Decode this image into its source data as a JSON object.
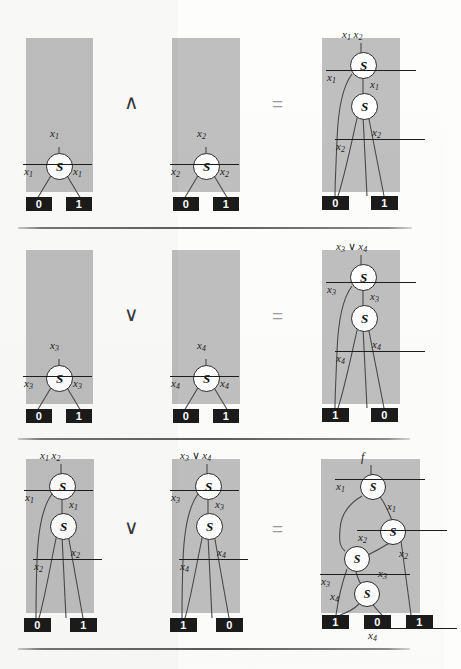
{
  "figure": {
    "kind": "binary-decision-diagram-identities",
    "node_symbol": "S",
    "colors": {
      "panel_gray": "#bfbfbf",
      "terminal_black": "#1b1b1b",
      "terminal_text": "#ffffff",
      "edge": "#4a4a4a",
      "page": "#fdfdfc"
    }
  },
  "rows": [
    {
      "id": "row-and",
      "operator": "∧",
      "equals": "=",
      "operands": [
        {
          "id": "and-left",
          "root_label": "x1",
          "nodes": [
            {
              "id": "n1",
              "label": "S",
              "var": "x1"
            }
          ],
          "edge_labels": [
            "x̄1",
            "x1"
          ],
          "terminals": [
            "0",
            "1"
          ]
        },
        {
          "id": "and-right",
          "root_label": "x2",
          "nodes": [
            {
              "id": "n1",
              "label": "S",
              "var": "x2"
            }
          ],
          "edge_labels": [
            "x̄2",
            "x2"
          ],
          "terminals": [
            "0",
            "1"
          ]
        }
      ],
      "result": {
        "id": "and-result",
        "root_label": "x1 x2",
        "nodes": [
          {
            "id": "n1",
            "label": "S",
            "var": "x1"
          },
          {
            "id": "n2",
            "label": "S",
            "var": "x2"
          }
        ],
        "edge_labels": [
          "x̄1",
          "x1",
          "x̄2",
          "x2"
        ],
        "terminals": [
          "0",
          "1"
        ]
      }
    },
    {
      "id": "row-or",
      "operator": "∨",
      "equals": "=",
      "operands": [
        {
          "id": "or-left",
          "root_label": "x3",
          "nodes": [
            {
              "id": "n1",
              "label": "S",
              "var": "x3"
            }
          ],
          "edge_labels": [
            "x̄3",
            "x3"
          ],
          "terminals": [
            "0",
            "1"
          ]
        },
        {
          "id": "or-right",
          "root_label": "x4",
          "nodes": [
            {
              "id": "n1",
              "label": "S",
              "var": "x4"
            }
          ],
          "edge_labels": [
            "x̄4",
            "x4"
          ],
          "terminals": [
            "0",
            "1"
          ]
        }
      ],
      "result": {
        "id": "or-result",
        "root_label": "x3 ∨ x4",
        "nodes": [
          {
            "id": "n1",
            "label": "S",
            "var": "x3"
          },
          {
            "id": "n2",
            "label": "S",
            "var": "x4"
          }
        ],
        "edge_labels": [
          "x̄3",
          "x3",
          "x̄4",
          "x4"
        ],
        "terminals": [
          "1",
          "0"
        ]
      }
    },
    {
      "id": "row-combine",
      "operator": "∨",
      "equals": "=",
      "operands": [
        {
          "id": "combine-left",
          "root_label": "x1 x2",
          "nodes": [
            {
              "id": "n1",
              "label": "S",
              "var": "x1"
            },
            {
              "id": "n2",
              "label": "S",
              "var": "x2"
            }
          ],
          "edge_labels": [
            "x̄1",
            "x1",
            "x̄2",
            "x2"
          ],
          "terminals": [
            "0",
            "1"
          ]
        },
        {
          "id": "combine-right",
          "root_label": "x3 ∨ x4",
          "nodes": [
            {
              "id": "n1",
              "label": "S",
              "var": "x3"
            },
            {
              "id": "n2",
              "label": "S",
              "var": "x4"
            }
          ],
          "edge_labels": [
            "x̄3",
            "x3",
            "x̄4",
            "x4"
          ],
          "terminals": [
            "1",
            "0"
          ]
        }
      ],
      "result": {
        "id": "combine-result",
        "root_label": "f",
        "nodes": [
          {
            "id": "n1",
            "label": "S",
            "var": "x1"
          },
          {
            "id": "n2",
            "label": "S",
            "var": "x2"
          },
          {
            "id": "n3",
            "label": "S",
            "var": "x3"
          },
          {
            "id": "n4",
            "label": "S",
            "var": "x4"
          }
        ],
        "edge_labels": [
          "x̄1",
          "x1",
          "x̄2",
          "x2",
          "x̄3",
          "x3",
          "x4",
          "x̄4"
        ],
        "terminals": [
          "1",
          "0",
          "1"
        ]
      }
    }
  ],
  "labels": {
    "r1": {
      "p1": {
        "root": "x",
        "root_sub": "1",
        "e_low": "x",
        "e_low_sub": "1",
        "e_high": "x",
        "e_high_sub": "1",
        "t0": "0",
        "t1": "1"
      },
      "p2": {
        "root": "x",
        "root_sub": "2",
        "e_low": "x",
        "e_low_sub": "2",
        "e_high": "x",
        "e_high_sub": "2",
        "t0": "0",
        "t1": "1"
      },
      "p3": {
        "root_a": "x",
        "root_a_sub": "1",
        "root_b": "x",
        "root_b_sub": "2",
        "e1_low": "x",
        "e1_low_sub": "1",
        "e1_high": "x",
        "e1_high_sub": "1",
        "e2_low": "x",
        "e2_low_sub": "2",
        "e2_high": "x",
        "e2_high_sub": "2",
        "t0": "0",
        "t1": "1"
      },
      "op": "∧",
      "eq": "="
    },
    "r2": {
      "p1": {
        "root": "x",
        "root_sub": "3",
        "e_low": "x",
        "e_low_sub": "3",
        "e_high": "x",
        "e_high_sub": "3",
        "t0": "0",
        "t1": "1"
      },
      "p2": {
        "root": "x",
        "root_sub": "4",
        "e_low": "x",
        "e_low_sub": "4",
        "e_high": "x",
        "e_high_sub": "4",
        "t0": "0",
        "t1": "1"
      },
      "p3": {
        "root_a": "x",
        "root_a_sub": "3",
        "root_op": "∨",
        "root_b": "x",
        "root_b_sub": "4",
        "e1_low": "x",
        "e1_low_sub": "3",
        "e1_high": "x",
        "e1_high_sub": "3",
        "e2_low": "x",
        "e2_low_sub": "4",
        "e2_high": "x",
        "e2_high_sub": "4",
        "t0": "1",
        "t1": "0"
      },
      "op": "∨",
      "eq": "="
    },
    "r3": {
      "p1": {
        "root_a": "x",
        "root_a_sub": "1",
        "root_b": "x",
        "root_b_sub": "2",
        "e1_low": "x",
        "e1_low_sub": "1",
        "e1_high": "x",
        "e1_high_sub": "1",
        "e2_low": "x",
        "e2_low_sub": "2",
        "e2_high": "x",
        "e2_high_sub": "2",
        "t0": "0",
        "t1": "1"
      },
      "p2": {
        "root_a": "x",
        "root_a_sub": "3",
        "root_op": "∨",
        "root_b": "x",
        "root_b_sub": "4",
        "e1_low": "x",
        "e1_low_sub": "3",
        "e1_high": "x",
        "e1_high_sub": "3",
        "e2_low": "x",
        "e2_low_sub": "4",
        "e2_high": "x",
        "e2_high_sub": "4",
        "t0": "1",
        "t1": "0"
      },
      "p3": {
        "root": "f",
        "e1_low": "x",
        "e1_low_sub": "1",
        "e1_high": "x",
        "e1_high_sub": "1",
        "e2_low": "x",
        "e2_low_sub": "2",
        "e2_high": "x",
        "e2_high_sub": "2",
        "e3_low": "x",
        "e3_low_sub": "3",
        "e3_high": "x",
        "e3_high_sub": "3",
        "e4_low": "x",
        "e4_low_sub": "4",
        "e4_high": "x",
        "e4_high_sub": "4",
        "t0": "1",
        "t1": "0",
        "t2": "1"
      },
      "op": "∨",
      "eq": "="
    },
    "node_symbol": "S"
  }
}
